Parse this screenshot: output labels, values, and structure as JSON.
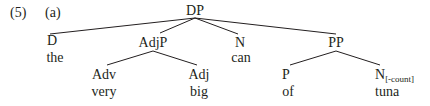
{
  "example": {
    "number": "(5)",
    "letter": "(a)"
  },
  "tree": {
    "root": {
      "label": "DP"
    },
    "d": {
      "label": "D",
      "word": "the"
    },
    "adjp": {
      "label": "AdjP",
      "adv": {
        "label": "Adv",
        "word": "very"
      },
      "adj": {
        "label": "Adj",
        "word": "big"
      }
    },
    "n": {
      "label": "N",
      "word": "can"
    },
    "pp": {
      "label": "PP",
      "p": {
        "label": "P",
        "word": "of"
      },
      "n": {
        "label": "N",
        "feature": "[-count]",
        "word": "tuna"
      }
    }
  },
  "colors": {
    "ink": "#231f20",
    "background": "#ffffff"
  }
}
